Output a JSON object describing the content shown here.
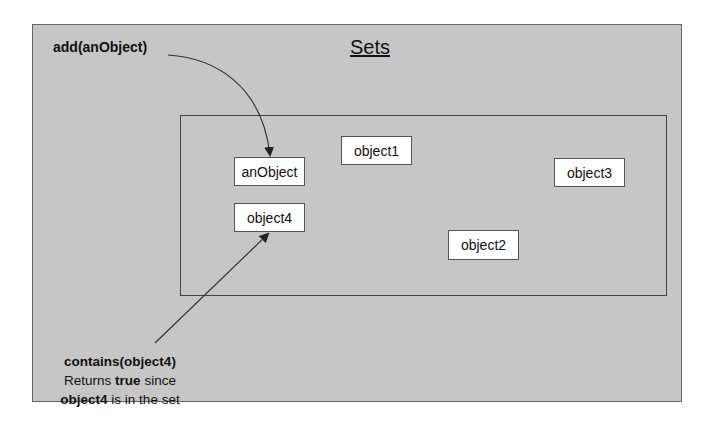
{
  "diagram": {
    "title": "Sets",
    "add_label": "add(anObject)",
    "contains_label": {
      "line1": "contains(object4)",
      "line2_pre": "Returns ",
      "line2_bold": "true",
      "line2_post": " since",
      "line3_bold": "object4",
      "line3_post": " is in the set"
    },
    "set_elements": [
      {
        "name": "anObject"
      },
      {
        "name": "object4"
      },
      {
        "name": "object1"
      },
      {
        "name": "object2"
      },
      {
        "name": "object3"
      }
    ],
    "colors": {
      "background": "#c6c6c6",
      "box": "#ffffff",
      "stroke": "#444444"
    }
  }
}
